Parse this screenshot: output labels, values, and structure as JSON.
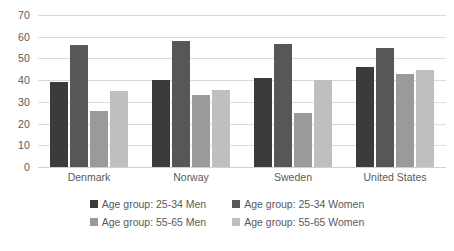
{
  "chart_data": {
    "type": "bar",
    "title": "",
    "subtitle": "",
    "xlabel": "",
    "ylabel": "",
    "categories": [
      "Denmark",
      "Norway",
      "Sweden",
      "United States"
    ],
    "series": [
      {
        "name": "Age group: 25-34 Men",
        "values": [
          39,
          40,
          41,
          46
        ],
        "color": "#3b3b3b"
      },
      {
        "name": "Age group: 25-34 Women",
        "values": [
          56,
          58,
          56.5,
          55
        ],
        "color": "#575757"
      },
      {
        "name": "Age group: 55-65 Men",
        "values": [
          26,
          33,
          25,
          43
        ],
        "color": "#9a9a9a"
      },
      {
        "name": "Age group: 55-65 Women",
        "values": [
          35,
          35.5,
          40,
          44.5
        ],
        "color": "#bfbfbf"
      }
    ],
    "ylim": [
      0,
      70
    ],
    "yticks": [
      0,
      10,
      20,
      30,
      40,
      50,
      60,
      70
    ],
    "ytick_labels": [
      "0",
      "10",
      "20",
      "30",
      "40",
      "50",
      "60",
      "70"
    ],
    "grid": true,
    "legend_position": "bottom",
    "gridline_color": "#d9d9d9",
    "text_color": "#595959",
    "background": "#ffffff"
  }
}
